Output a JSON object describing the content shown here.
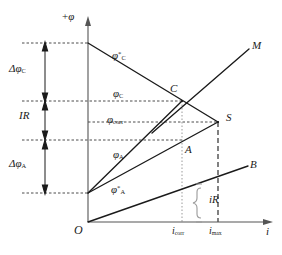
{
  "figure": {
    "type": "evans-polarization-diagram",
    "axes": {
      "y_label": "+φ",
      "x_label": "i",
      "origin_label": "O"
    },
    "potential_levels": [
      {
        "key": "phi_C_star",
        "base": "φ",
        "sub": "C",
        "sup": "*",
        "y": 43,
        "dash_from": 22,
        "dash_to": 88
      },
      {
        "key": "phi_C",
        "base": "φ",
        "sub": "C",
        "sup": "",
        "y": 101,
        "dash_from": 22,
        "dash_to": 182
      },
      {
        "key": "phi_corr",
        "base": "φ",
        "sub": "corr",
        "sup": "",
        "y": 122,
        "dash_from": 88,
        "dash_to": 218
      },
      {
        "key": "phi_A",
        "base": "φ",
        "sub": "A",
        "sup": "",
        "y": 140,
        "dash_from": 22,
        "dash_to": 182
      },
      {
        "key": "phi_A_star",
        "base": "φ",
        "sub": "A",
        "sup": "*",
        "y": 193,
        "dash_from": 22,
        "dash_to": 88
      }
    ],
    "brackets": [
      {
        "key": "delta_phi_C",
        "label_base": "Δφ",
        "label_sub": "C",
        "y_top": 43,
        "y_bottom": 101,
        "label_y": 64
      },
      {
        "key": "IR",
        "label_base": "IR",
        "label_sub": "",
        "y_top": 101,
        "y_bottom": 140,
        "label_y": 111
      },
      {
        "key": "delta_phi_A",
        "label_base": "Δφ",
        "label_sub": "A",
        "y_top": 140,
        "y_bottom": 193,
        "label_y": 159
      }
    ],
    "curves": [
      {
        "key": "cathodic-line",
        "label": "",
        "points": [
          [
            88,
            43
          ],
          [
            218,
            122
          ]
        ]
      },
      {
        "key": "anodic-line-C",
        "label": "",
        "points": [
          [
            88,
            193
          ],
          [
            182,
            101
          ]
        ]
      },
      {
        "key": "anodic-line-S",
        "label": "",
        "points": [
          [
            88,
            193
          ],
          [
            218,
            122
          ]
        ]
      },
      {
        "key": "line-M",
        "label": "M",
        "points": [
          [
            152,
            133
          ],
          [
            250,
            48
          ]
        ],
        "label_x": 253,
        "label_y": 42
      },
      {
        "key": "line-B",
        "label": "B",
        "points": [
          [
            88,
            222
          ],
          [
            248,
            166
          ]
        ],
        "label_x": 251,
        "label_y": 161
      }
    ],
    "points": [
      {
        "key": "point-C",
        "label": "C",
        "x": 182,
        "y": 101,
        "label_x": 172,
        "label_y": 86
      },
      {
        "key": "point-S",
        "label": "S",
        "x": 218,
        "y": 122,
        "label_x": 228,
        "label_y": 114
      },
      {
        "key": "point-A",
        "label": "A",
        "x": 182,
        "y": 140,
        "label_x": 186,
        "label_y": 147
      }
    ],
    "current_markers": [
      {
        "key": "i_corr",
        "base": "i",
        "sub": "corr",
        "x": 182,
        "y_top": 101,
        "style": "dotted",
        "label_x": 171,
        "label_y": 226
      },
      {
        "key": "i_max",
        "base": "i",
        "sub": "max",
        "x": 218,
        "y_top": 122,
        "style": "dashed",
        "label_x": 208,
        "label_y": 226
      }
    ],
    "iR_brace": {
      "label": "iR",
      "x": 199,
      "y_top": 184,
      "y_bottom": 222,
      "label_x": 206,
      "label_y": 196
    },
    "colors": {
      "line": "#1a1a1a",
      "dashed": "#4d4d4d",
      "dotted": "#999999",
      "background": "#ffffff"
    }
  }
}
